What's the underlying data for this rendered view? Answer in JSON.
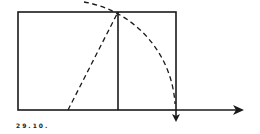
{
  "figure": {
    "caption": "29.10.",
    "colors": {
      "stroke": "#1a1a1a",
      "background": "#ffffff"
    }
  },
  "geometry": {
    "rect": {
      "x1": 18,
      "y1": 12,
      "x2": 176,
      "y2": 110
    },
    "divider_x": 118,
    "midpoint": {
      "x": 68,
      "y": 110
    },
    "apex": {
      "x": 118,
      "y": 12
    },
    "arc_radius": 110,
    "axis_end_x": 242,
    "down_arrow": {
      "x": 176,
      "tip_y": 122
    }
  }
}
